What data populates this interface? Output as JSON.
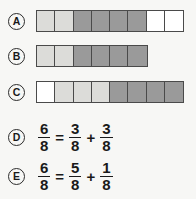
{
  "options": [
    {
      "letter": "A",
      "type": "bar",
      "cells": [
        "light",
        "light",
        "dark",
        "dark",
        "dark",
        "dark",
        "white",
        "white"
      ]
    },
    {
      "letter": "B",
      "type": "bar",
      "cells": [
        "light",
        "light",
        "dark",
        "dark",
        "dark",
        "dark"
      ]
    },
    {
      "letter": "C",
      "type": "bar",
      "cells": [
        "white",
        "light",
        "light",
        "light",
        "dark",
        "dark",
        "dark",
        "dark"
      ]
    },
    {
      "letter": "D",
      "type": "equation",
      "equation": {
        "left": {
          "num": "6",
          "den": "8"
        },
        "relation": "=",
        "term1": {
          "num": "3",
          "den": "8"
        },
        "operator": "+",
        "term2": {
          "num": "3",
          "den": "8"
        }
      }
    },
    {
      "letter": "E",
      "type": "equation",
      "equation": {
        "left": {
          "num": "6",
          "den": "8"
        },
        "relation": "=",
        "term1": {
          "num": "5",
          "den": "8"
        },
        "operator": "+",
        "term2": {
          "num": "1",
          "den": "8"
        }
      }
    }
  ],
  "colors": {
    "background": "#f7f7f5",
    "light_cell": "#dcdcd9",
    "dark_cell": "#9a9a9a",
    "white_cell": "#ffffff",
    "border": "#4a4a4a",
    "text": "#1a1a1a"
  }
}
